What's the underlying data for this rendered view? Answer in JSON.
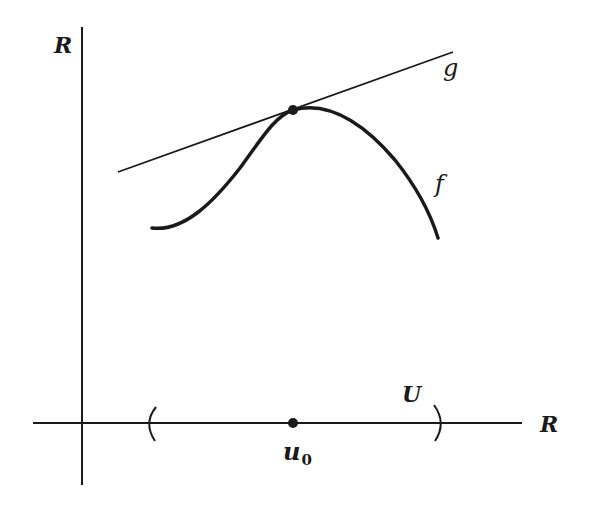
{
  "figure": {
    "colors": {
      "ink": "#1a1a1a",
      "background": "#ffffff"
    },
    "labels": {
      "y_axis": "R",
      "x_axis": "R",
      "tangent_line": "g",
      "curve": "f",
      "neighborhood": "U",
      "point_base": "u",
      "point_subscript": "0"
    },
    "axes": {
      "vertical": {
        "x": 82,
        "y_top": 27,
        "y_bottom": 485
      },
      "horizontal": {
        "y": 423,
        "x_left": 33,
        "x_right": 522
      }
    },
    "tangent_point": {
      "x": 293,
      "y": 110
    },
    "neighborhood_interval": {
      "left_paren_x": 150,
      "right_paren_x": 440
    },
    "u0_point": {
      "x": 293,
      "y": 423
    }
  }
}
